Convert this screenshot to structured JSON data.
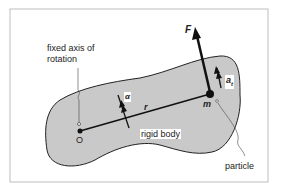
{
  "figure": {
    "colors": {
      "body_fill": "#c9c9c9",
      "stroke": "#222222",
      "frame": "#bdbdbd"
    },
    "labels": {
      "axis": "fixed axis of",
      "axis2": "rotation",
      "origin": "O",
      "radius": "r",
      "alpha": "α",
      "force": "F",
      "mass": "m",
      "tangential_accel": "a",
      "tangential_sub": "t",
      "body": "rigid body",
      "particle": "particle"
    }
  }
}
